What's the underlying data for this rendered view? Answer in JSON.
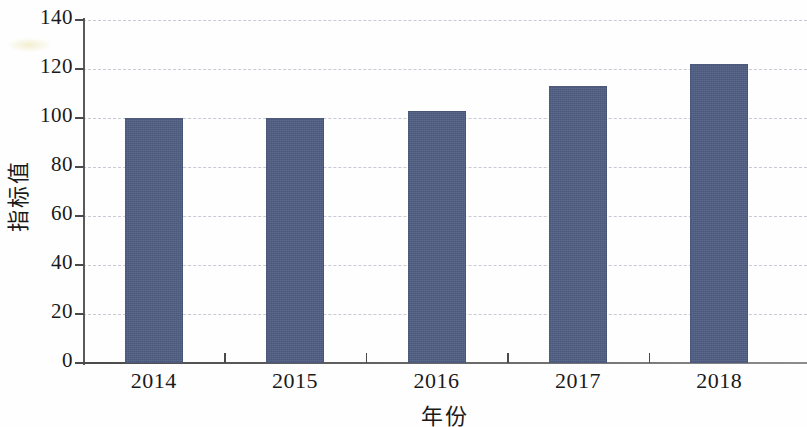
{
  "chart_data": {
    "type": "bar",
    "title": "",
    "subtitle": "",
    "xlabel": "年份",
    "ylabel": "指标值",
    "categories": [
      "2014",
      "2015",
      "2016",
      "2017",
      "2018"
    ],
    "values": [
      100,
      100,
      103,
      113,
      122
    ],
    "series": [
      {
        "name": "指标值",
        "values": [
          100,
          100,
          103,
          113,
          122
        ]
      }
    ],
    "ylim": [
      0,
      140
    ],
    "ytick_labels": [
      "0",
      "20",
      "40",
      "60",
      "80",
      "100",
      "120",
      "140"
    ],
    "ytick_values": [
      0,
      20,
      40,
      60,
      80,
      100,
      120,
      140
    ],
    "ytick_step": 20,
    "grid": "horizontal-dashed",
    "legend": "none",
    "annotations": [],
    "colors": {
      "bar": "#4f5d82",
      "gridline": "#c9c9d6",
      "axis": "#4a4a4a",
      "text": "#1a1a1a",
      "background": "#fefefe"
    }
  }
}
